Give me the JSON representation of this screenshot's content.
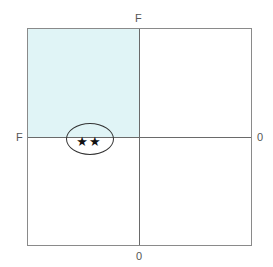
{
  "diagram": {
    "type": "quadrant-grid",
    "axes": {
      "top_label": "F",
      "left_label": "F",
      "right_label": "0",
      "bottom_label": "0"
    },
    "quadrants": [
      {
        "position": "top-left",
        "highlighted": true,
        "fill": "#e0f4f6"
      },
      {
        "position": "top-right",
        "highlighted": false,
        "fill": "#ffffff"
      },
      {
        "position": "bottom-left",
        "highlighted": false,
        "fill": "#ffffff"
      },
      {
        "position": "bottom-right",
        "highlighted": false,
        "fill": "#ffffff"
      }
    ],
    "marker": {
      "quadrant": "top-left",
      "shape": "ellipse",
      "content": "★★",
      "star_count": 2
    },
    "colors": {
      "border": "#8a8a8a",
      "axis": "#6a6a6a",
      "highlight": "#e0f4f6",
      "ellipse_stroke": "#333333",
      "star": "#111111"
    }
  }
}
